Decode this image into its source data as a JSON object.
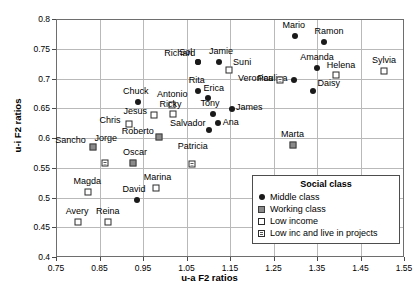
{
  "chart_data": {
    "type": "scatter",
    "title": "",
    "xlabel": "u-a F2 ratios",
    "ylabel": "u-i F2 ratios",
    "xlim": [
      0.75,
      1.55
    ],
    "ylim": [
      0.4,
      0.8
    ],
    "xticks": [
      "0.75",
      "0.85",
      "0.95",
      "1.05",
      "1.15",
      "1.25",
      "1.35",
      "1.45",
      "1.55"
    ],
    "yticks": [
      "0.4",
      "0.45",
      "0.5",
      "0.55",
      "0.6",
      "0.65",
      "0.7",
      "0.75",
      "0.8"
    ],
    "grid": true,
    "legend_position": "lower-right",
    "legend_title": "Social class",
    "series": [
      {
        "name": "Middle class",
        "marker": "filled-circle",
        "color": "#1a1a1a",
        "points": [
          {
            "label": "Mario",
            "x": 1.299,
            "y": 0.771
          },
          {
            "label": "Ramon",
            "x": 1.366,
            "y": 0.761
          },
          {
            "label": "Sol",
            "x": 1.076,
            "y": 0.728
          },
          {
            "label": "Jamie",
            "x": 1.125,
            "y": 0.728
          },
          {
            "label": "Richard",
            "x": 1.076,
            "y": 0.728
          },
          {
            "label": "Amanda",
            "x": 1.35,
            "y": 0.718
          },
          {
            "label": "Paulina",
            "x": 1.296,
            "y": 0.697
          },
          {
            "label": "Rita",
            "x": 1.076,
            "y": 0.679
          },
          {
            "label": "Erica",
            "x": 1.099,
            "y": 0.667
          },
          {
            "label": "Daisy",
            "x": 1.34,
            "y": 0.679
          },
          {
            "label": "James",
            "x": 1.155,
            "y": 0.649
          },
          {
            "label": "Chuck",
            "x": 0.938,
            "y": 0.661
          },
          {
            "label": "Tony",
            "x": 1.111,
            "y": 0.641
          },
          {
            "label": "Ana",
            "x": 1.122,
            "y": 0.626
          },
          {
            "label": "Salvador",
            "x": 1.101,
            "y": 0.614
          },
          {
            "label": "David",
            "x": 0.936,
            "y": 0.496
          }
        ]
      },
      {
        "name": "Working class",
        "marker": "gray-square",
        "color": "#8a8a8a",
        "points": [
          {
            "label": "Marta",
            "x": 1.294,
            "y": 0.588
          },
          {
            "label": "Roberto",
            "x": 0.986,
            "y": 0.602
          },
          {
            "label": "Oscar",
            "x": 0.927,
            "y": 0.558
          },
          {
            "label": "Sancho",
            "x": 0.834,
            "y": 0.585
          }
        ]
      },
      {
        "name": "Low income",
        "marker": "open-square",
        "color": "#ffffff",
        "points": [
          {
            "label": "Sylvia",
            "x": 1.504,
            "y": 0.713
          },
          {
            "label": "Helena",
            "x": 1.394,
            "y": 0.706
          },
          {
            "label": "Suni",
            "x": 1.148,
            "y": 0.714
          },
          {
            "label": "Antonio",
            "x": 1.017,
            "y": 0.655
          },
          {
            "label": "Ricky",
            "x": 1.02,
            "y": 0.641
          },
          {
            "label": "Jesus",
            "x": 0.976,
            "y": 0.638
          },
          {
            "label": "Chris",
            "x": 0.918,
            "y": 0.623
          },
          {
            "label": "Marina",
            "x": 0.979,
            "y": 0.516
          },
          {
            "label": "Magda",
            "x": 0.824,
            "y": 0.509
          },
          {
            "label": "Avery",
            "x": 0.801,
            "y": 0.459
          },
          {
            "label": "Reina",
            "x": 0.869,
            "y": 0.459
          }
        ]
      },
      {
        "name": "Low inc and live in projects",
        "marker": "hatched-square",
        "color": "#ffffff",
        "points": [
          {
            "label": "Veronica",
            "x": 1.266,
            "y": 0.697
          },
          {
            "label": "Patricia",
            "x": 1.062,
            "y": 0.568
          },
          {
            "label": "Jorge",
            "x": 0.862,
            "y": 0.582
          }
        ]
      }
    ]
  },
  "legend": {
    "title": "Social class",
    "entries": [
      {
        "label": "Middle class",
        "marker": "filled-circle"
      },
      {
        "label": "Working class",
        "marker": "gray-square"
      },
      {
        "label": "Low income",
        "marker": "open-square"
      },
      {
        "label": "Low inc and live in projects",
        "marker": "hatched-square"
      }
    ]
  },
  "axes": {
    "xlabel": "u-a F2 ratios",
    "ylabel": "u-i F2 ratios"
  }
}
